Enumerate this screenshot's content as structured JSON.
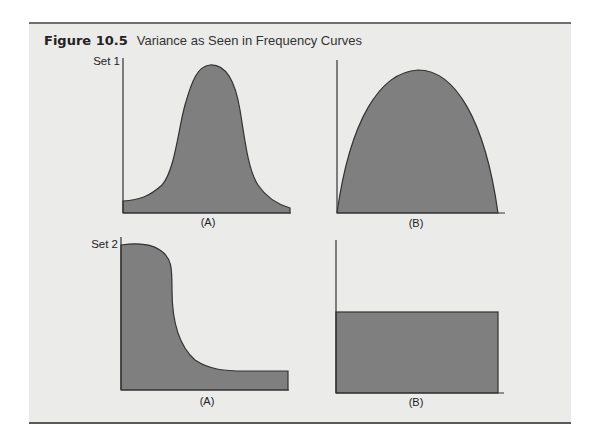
{
  "figure": {
    "number": "Figure 10.5",
    "caption": "Variance as Seen in Frequency Curves"
  },
  "sets": [
    {
      "label": "Set 1",
      "panels": [
        {
          "label": "(A)",
          "shape": "narrow bell curve (small variance)"
        },
        {
          "label": "(B)",
          "shape": "broad inverted-parabola curve (larger variance)"
        }
      ]
    },
    {
      "label": "Set 2",
      "panels": [
        {
          "label": "(A)",
          "shape": "high at left, sharp drop, long flat tail"
        },
        {
          "label": "(B)",
          "shape": "uniform rectangle"
        }
      ]
    }
  ],
  "colors": {
    "fill": "#7f7f7f",
    "stroke": "#333333",
    "background": "#ebebea",
    "rule": "#5a5a5a"
  }
}
